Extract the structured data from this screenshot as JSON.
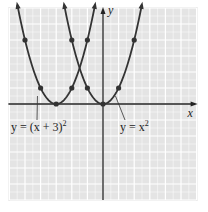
{
  "chart_data": {
    "type": "line",
    "title": "",
    "xlabel": "x",
    "ylabel": "y",
    "xlim": [
      -6,
      6
    ],
    "ylim": [
      -6,
      6
    ],
    "grid": true,
    "series": [
      {
        "name": "y = x^2",
        "label": "y = x",
        "label_sup": "2",
        "function": "x^2",
        "points": [
          [
            -2,
            4
          ],
          [
            -1,
            1
          ],
          [
            0,
            0
          ],
          [
            1,
            1
          ],
          [
            2,
            4
          ]
        ],
        "label_anchor": [
          0.8,
          0.5
        ]
      },
      {
        "name": "y = (x + 3)^2",
        "label": "y = (x + 3)",
        "label_sup": "2",
        "function": "(x+3)^2",
        "points": [
          [
            -5,
            4
          ],
          [
            -4,
            1
          ],
          [
            -3,
            0
          ],
          [
            -2,
            1
          ],
          [
            -1,
            4
          ]
        ],
        "label_anchor": [
          -4.2,
          0.5
        ]
      }
    ],
    "colors": {
      "background": "#e4e4e4",
      "grid": "#ffffff",
      "curve": "#333333",
      "axis": "#222222"
    }
  }
}
